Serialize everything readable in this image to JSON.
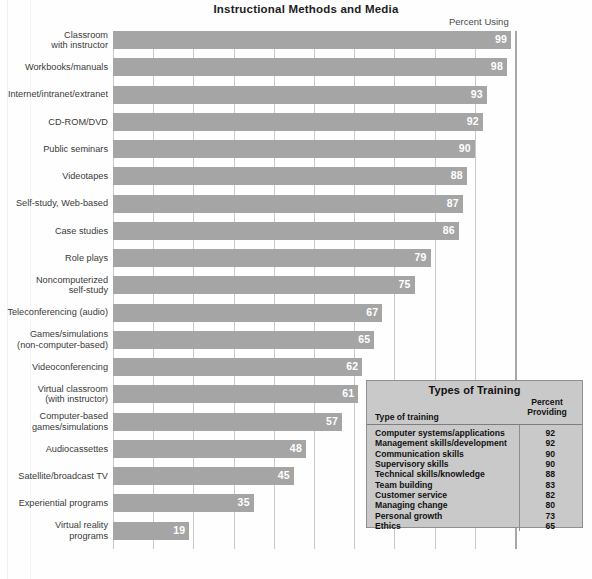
{
  "chart_data": {
    "type": "bar",
    "title": "Instructional Methods and Media",
    "xlabel": "",
    "ylabel": "",
    "value_axis_label": "Percent Using",
    "orientation": "horizontal",
    "xlim": [
      0,
      100
    ],
    "xticks": [
      0,
      10,
      20,
      30,
      40,
      50,
      60,
      70,
      80,
      90,
      100
    ],
    "grid": true,
    "legend": "none",
    "bar_color": "#a5a5a5",
    "categories": [
      "Classroom\nwith instructor",
      "Workbooks/manuals",
      "Internet/intranet/extranet",
      "CD-ROM/DVD",
      "Public seminars",
      "Videotapes",
      "Self-study, Web-based",
      "Case studies",
      "Role plays",
      "Noncomputerized\nself-study",
      "Teleconferencing (audio)",
      "Games/simulations\n(non-computer-based)",
      "Videoconferencing",
      "Virtual classroom\n(with instructor)",
      "Computer-based\ngames/simulations",
      "Audiocassettes",
      "Satellite/broadcast TV",
      "Experiential programs",
      "Virtual reality\nprograms"
    ],
    "values": [
      99,
      98,
      93,
      92,
      90,
      88,
      87,
      86,
      79,
      75,
      67,
      65,
      62,
      61,
      57,
      48,
      45,
      35,
      19
    ]
  },
  "table": {
    "title": "Types of Training",
    "col_headers": [
      "Type of training",
      "Percent\nProviding"
    ],
    "rows": [
      {
        "name": "Computer systems/applications",
        "value": "92"
      },
      {
        "name": "Management skills/development",
        "value": "92"
      },
      {
        "name": "Communication skills",
        "value": "90"
      },
      {
        "name": "Supervisory skills",
        "value": "90"
      },
      {
        "name": "Technical skills/knowledge",
        "value": "88"
      },
      {
        "name": "Team building",
        "value": "83"
      },
      {
        "name": "Customer service",
        "value": "82"
      },
      {
        "name": "Managing change",
        "value": "80"
      },
      {
        "name": "Personal growth",
        "value": "73"
      },
      {
        "name": "Ethics",
        "value": "65"
      }
    ]
  }
}
